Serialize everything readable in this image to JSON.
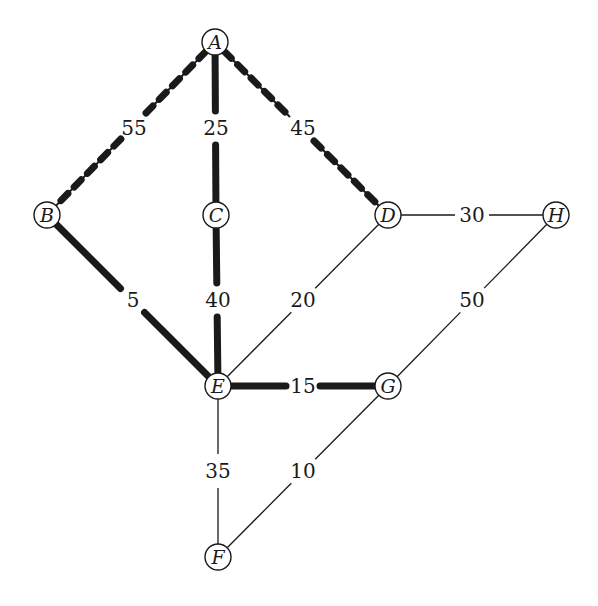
{
  "diagram": {
    "type": "weighted-undirected-graph",
    "colors": {
      "ink": "#1a1a1a",
      "background": "#ffffff"
    },
    "nodes": [
      {
        "id": "A",
        "label": "A",
        "x": 215,
        "y": 42
      },
      {
        "id": "B",
        "label": "B",
        "x": 47,
        "y": 215
      },
      {
        "id": "C",
        "label": "C",
        "x": 216,
        "y": 215
      },
      {
        "id": "D",
        "label": "D",
        "x": 388,
        "y": 215
      },
      {
        "id": "H",
        "label": "H",
        "x": 556,
        "y": 215
      },
      {
        "id": "E",
        "label": "E",
        "x": 218,
        "y": 386
      },
      {
        "id": "G",
        "label": "G",
        "x": 388,
        "y": 386
      },
      {
        "id": "F",
        "label": "F",
        "x": 218,
        "y": 557
      }
    ],
    "edges": [
      {
        "from": "A",
        "to": "B",
        "weight": "55",
        "style": "beaded",
        "label_x": 134,
        "label_y": 128
      },
      {
        "from": "A",
        "to": "C",
        "weight": "25",
        "style": "thick",
        "label_x": 216,
        "label_y": 128
      },
      {
        "from": "A",
        "to": "D",
        "weight": "45",
        "style": "beaded",
        "label_x": 303,
        "label_y": 128
      },
      {
        "from": "B",
        "to": "E",
        "weight": "5",
        "style": "thick",
        "label_x": 133,
        "label_y": 300
      },
      {
        "from": "C",
        "to": "E",
        "weight": "40",
        "style": "thick",
        "label_x": 218,
        "label_y": 300
      },
      {
        "from": "D",
        "to": "E",
        "weight": "20",
        "style": "thin",
        "label_x": 303,
        "label_y": 300
      },
      {
        "from": "D",
        "to": "H",
        "weight": "30",
        "style": "thin",
        "label_x": 472,
        "label_y": 215
      },
      {
        "from": "H",
        "to": "G",
        "weight": "50",
        "style": "thin",
        "label_x": 472,
        "label_y": 300
      },
      {
        "from": "E",
        "to": "G",
        "weight": "15",
        "style": "thick",
        "label_x": 303,
        "label_y": 386
      },
      {
        "from": "E",
        "to": "F",
        "weight": "35",
        "style": "thin",
        "label_x": 218,
        "label_y": 471
      },
      {
        "from": "F",
        "to": "G",
        "weight": "10",
        "style": "thin",
        "label_x": 303,
        "label_y": 471
      }
    ]
  }
}
